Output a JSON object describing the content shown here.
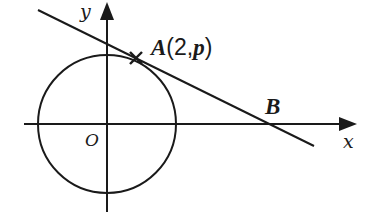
{
  "diagram": {
    "type": "coordinate-geometry",
    "colors": {
      "stroke": "#1a1a1a",
      "background": "#ffffff"
    },
    "axes": {
      "x_label": "x",
      "y_label": "y",
      "origin_label": "O"
    },
    "circle": {
      "center": "O"
    },
    "points": {
      "A": {
        "name": "A",
        "open_paren": "(",
        "coords": "2,",
        "p": "p",
        "close_paren": ")"
      },
      "B": {
        "name": "B"
      }
    },
    "tangent_line": {
      "through": [
        "A",
        "B"
      ]
    }
  }
}
